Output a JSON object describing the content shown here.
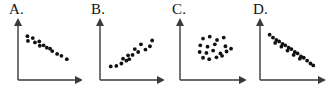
{
  "figure": {
    "width": 327,
    "height": 93,
    "background": "#ffffff",
    "dot_color": "#111111",
    "axis_color": "#3a3a3a",
    "panel_count": 4
  },
  "chart_data": [
    {
      "type": "scatter",
      "title": "A.",
      "xlabel": "",
      "ylabel": "",
      "xlim": [
        0,
        10
      ],
      "ylim": [
        0,
        10
      ],
      "grid": false,
      "legend": "none",
      "axes_style": "L-shaped with arrowheads",
      "relationship": "moderate negative correlation",
      "series": [
        {
          "name": "A",
          "x": [
            1.0,
            1.1,
            2.0,
            2.4,
            3.2,
            3.3,
            4.0,
            4.6,
            5.2,
            5.6,
            6.5,
            7.3,
            8.3
          ],
          "y": [
            8.3,
            7.3,
            7.9,
            7.0,
            7.2,
            6.3,
            6.4,
            5.9,
            5.7,
            5.2,
            4.6,
            4.2,
            3.5
          ]
        }
      ]
    },
    {
      "type": "scatter",
      "title": "B.",
      "xlabel": "",
      "ylabel": "",
      "xlim": [
        0,
        10
      ],
      "ylim": [
        0,
        10
      ],
      "grid": false,
      "legend": "none",
      "axes_style": "L-shaped with arrowheads",
      "relationship": "moderate positive correlation",
      "series": [
        {
          "name": "B",
          "x": [
            1.2,
            2.2,
            3.1,
            3.4,
            4.0,
            4.3,
            4.5,
            5.1,
            5.5,
            6.1,
            6.6,
            7.4,
            8.2,
            8.6
          ],
          "y": [
            2.0,
            2.1,
            2.6,
            3.6,
            3.2,
            4.3,
            3.5,
            4.4,
            5.6,
            5.0,
            6.6,
            5.5,
            6.2,
            7.4
          ]
        }
      ]
    },
    {
      "type": "scatter",
      "title": "C.",
      "xlabel": "",
      "ylabel": "",
      "xlim": [
        0,
        10
      ],
      "ylim": [
        0,
        10
      ],
      "grid": false,
      "legend": "none",
      "axes_style": "L-shaped with arrowheads",
      "relationship": "no correlation (random cluster)",
      "series": [
        {
          "name": "C",
          "x": [
            3.4,
            4.6,
            5.9,
            7.1,
            2.9,
            4.2,
            5.5,
            7.4,
            8.4,
            2.8,
            4.0,
            5.2,
            6.5,
            7.6,
            3.4,
            4.5,
            5.8,
            6.8
          ],
          "y": [
            7.8,
            8.2,
            7.5,
            8.0,
            6.4,
            6.1,
            6.6,
            6.2,
            5.7,
            5.0,
            4.8,
            5.3,
            4.7,
            5.1,
            3.8,
            3.5,
            3.9,
            4.2
          ]
        }
      ]
    },
    {
      "type": "scatter",
      "title": "D.",
      "xlabel": "",
      "ylabel": "",
      "xlim": [
        0,
        10
      ],
      "ylim": [
        0,
        10
      ],
      "grid": false,
      "legend": "none",
      "axes_style": "L-shaped with arrowheads",
      "relationship": "strong negative correlation",
      "series": [
        {
          "name": "D",
          "x": [
            1.0,
            1.6,
            2.2,
            2.0,
            2.7,
            3.3,
            3.1,
            3.8,
            4.4,
            4.2,
            4.9,
            5.5,
            5.3,
            6.0,
            6.6,
            6.4,
            7.1,
            7.7,
            8.3,
            8.8
          ],
          "y": [
            8.6,
            8.0,
            7.5,
            6.9,
            7.2,
            6.7,
            6.1,
            6.4,
            5.9,
            5.3,
            5.6,
            5.0,
            4.4,
            4.7,
            4.1,
            3.6,
            3.8,
            3.2,
            2.6,
            2.2
          ]
        }
      ]
    }
  ],
  "panels": [
    {
      "label": "A.",
      "label_left": 9,
      "offset": 0
    },
    {
      "label": "B.",
      "label_left": 9,
      "offset": 82
    },
    {
      "label": "C.",
      "label_left": 8,
      "offset": 164
    },
    {
      "label": "D.",
      "label_left": 8,
      "offset": 245
    }
  ]
}
